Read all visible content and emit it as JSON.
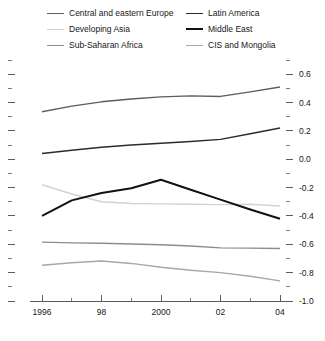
{
  "chart_data": {
    "type": "line",
    "title": "",
    "xlabel": "",
    "ylabel": "",
    "x": [
      1996,
      1997,
      1998,
      1999,
      2000,
      2001,
      2002,
      2003,
      2004
    ],
    "tick_labels_x": [
      "1996",
      "98",
      "2000",
      "02",
      "04"
    ],
    "tick_values_x": [
      1996,
      1998,
      2000,
      2002,
      2004
    ],
    "tick_labels_y": [
      "0.6",
      "0.4",
      "0.2",
      "0.0",
      "-0.2",
      "-0.4",
      "-0.6",
      "-0.8",
      "-1.0"
    ],
    "tick_values_y": [
      0.6,
      0.4,
      0.2,
      0.0,
      -0.2,
      -0.4,
      -0.6,
      -0.8,
      -1.0
    ],
    "minor_tick_step_y": 0.1,
    "ylim": [
      -1.0,
      0.7
    ],
    "xlim": [
      1996,
      2004
    ],
    "grid": false,
    "y_axis_position": "right",
    "legend_position": "top",
    "series": [
      {
        "name": "Central and eastern Europe",
        "color": "#5d5d5d",
        "width": 1.4,
        "values": [
          0.335,
          0.375,
          0.405,
          0.425,
          0.44,
          0.447,
          0.443,
          0.475,
          0.51
        ]
      },
      {
        "name": "Developing Asia",
        "color": "#d2d2d2",
        "width": 1.4,
        "values": [
          -0.18,
          -0.245,
          -0.3,
          -0.312,
          -0.315,
          -0.318,
          -0.32,
          -0.318,
          -0.33
        ]
      },
      {
        "name": "Sub-Saharan Africa",
        "color": "#8c8c8c",
        "width": 1.4,
        "values": [
          -0.585,
          -0.59,
          -0.593,
          -0.598,
          -0.603,
          -0.612,
          -0.625,
          -0.627,
          -0.63
        ]
      },
      {
        "name": "Latin America",
        "color": "#2b2b2b",
        "width": 1.4,
        "values": [
          0.04,
          0.063,
          0.085,
          0.1,
          0.113,
          0.125,
          0.14,
          0.18,
          0.22
        ]
      },
      {
        "name": "Middle East",
        "color": "#121212",
        "width": 2.0,
        "values": [
          -0.4,
          -0.29,
          -0.238,
          -0.205,
          -0.145,
          -0.215,
          -0.285,
          -0.355,
          -0.42
        ]
      },
      {
        "name": "CIS and Mongolia",
        "color": "#a8a8a8",
        "width": 1.4,
        "values": [
          -0.748,
          -0.73,
          -0.718,
          -0.735,
          -0.762,
          -0.783,
          -0.8,
          -0.825,
          -0.858
        ]
      }
    ]
  },
  "legend": {
    "columns": [
      {
        "items": [
          {
            "label": "Central and eastern Europe",
            "color": "#5d5d5d",
            "width": 1.4
          },
          {
            "label": "Developing Asia",
            "color": "#d2d2d2",
            "width": 1.4
          },
          {
            "label": "Sub-Saharan Africa",
            "color": "#8c8c8c",
            "width": 1.4
          }
        ]
      },
      {
        "items": [
          {
            "label": "Latin America",
            "color": "#2b2b2b",
            "width": 1.4
          },
          {
            "label": "Middle East",
            "color": "#121212",
            "width": 2.0
          },
          {
            "label": "CIS and Mongolia",
            "color": "#a8a8a8",
            "width": 1.4
          }
        ]
      }
    ]
  }
}
